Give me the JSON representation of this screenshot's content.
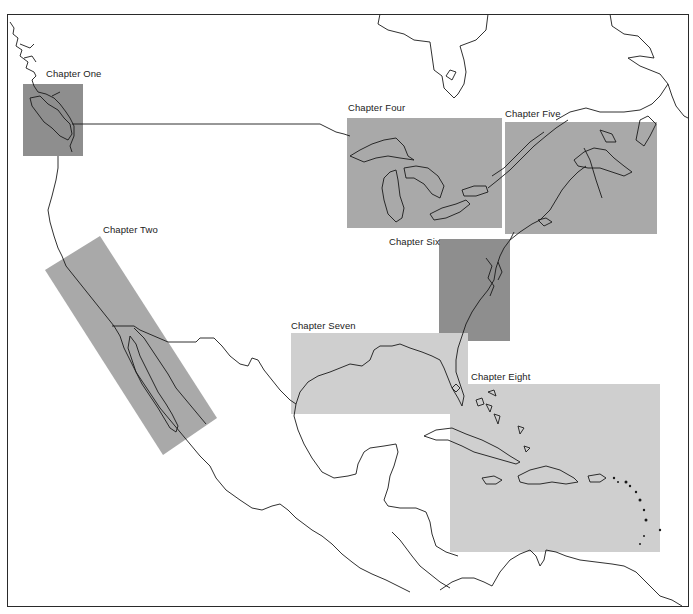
{
  "map": {
    "title": "",
    "colors": {
      "background": "#ffffff",
      "coastline": "#1a1a1a",
      "border": "#2a2a2a",
      "region_dark": "#8e8e8e",
      "region_medium": "#a9a9a9",
      "region_light": "#cfcfcf"
    },
    "regions": [
      {
        "id": "chapter-one",
        "label": "Chapter One",
        "area": "Pacific Northwest / Vancouver Island",
        "shade": "dark",
        "label_x": 46,
        "label_y": 68
      },
      {
        "id": "chapter-two",
        "label": "Chapter Two",
        "area": "California / Baja California",
        "shade": "medium",
        "label_x": 103,
        "label_y": 224
      },
      {
        "id": "chapter-four",
        "label": "Chapter Four",
        "area": "Great Lakes",
        "shade": "medium",
        "label_x": 348,
        "label_y": 102
      },
      {
        "id": "chapter-five",
        "label": "Chapter Five",
        "area": "New England / Maritimes",
        "shade": "medium",
        "label_x": 505,
        "label_y": 108
      },
      {
        "id": "chapter-six",
        "label": "Chapter Six",
        "area": "Mid-Atlantic / Chesapeake",
        "shade": "dark",
        "label_x": 389,
        "label_y": 236
      },
      {
        "id": "chapter-seven",
        "label": "Chapter Seven",
        "area": "Gulf of Mexico / Florida",
        "shade": "light",
        "label_x": 291,
        "label_y": 320
      },
      {
        "id": "chapter-eight",
        "label": "Chapter Eight",
        "area": "Caribbean",
        "shade": "light",
        "label_x": 471,
        "label_y": 371
      }
    ]
  }
}
